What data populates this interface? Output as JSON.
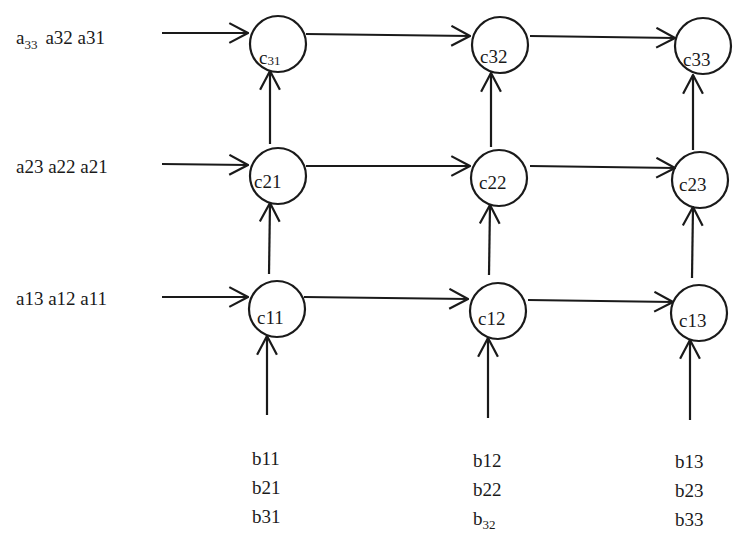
{
  "diagram": {
    "type": "systolic-array",
    "row_inputs": [
      {
        "id": "row3",
        "parts": [
          {
            "base": "a",
            "sub": "33"
          },
          {
            "text": " a32 a31"
          }
        ]
      },
      {
        "id": "row2",
        "parts": [
          {
            "text": "a23 a22 a21"
          }
        ]
      },
      {
        "id": "row1",
        "parts": [
          {
            "text": "a13 a12 a11"
          }
        ]
      }
    ],
    "row_input_text": {
      "row3_base": "a",
      "row3_sub": "33",
      "row3_rest": "a32 a31",
      "row2": "a23 a22 a21",
      "row1": "a13 a12 a11"
    },
    "cells": {
      "c31_base": "c",
      "c31_sub": "31",
      "c32": "c32",
      "c33": "c33",
      "c21": "c21",
      "c22": "c22",
      "c23": "c23",
      "c11": "c11",
      "c12": "c12",
      "c13": "c13"
    },
    "column_inputs": {
      "col1": [
        "b11",
        "b21",
        "b31"
      ],
      "col2_line1": "b12",
      "col2_line2": "b22",
      "col2_line3_base": "b",
      "col2_line3_sub": "32",
      "col3": [
        "b13",
        "b23",
        "b33"
      ]
    },
    "colors": {
      "stroke": "#1a1a1a",
      "background": "#ffffff"
    }
  }
}
